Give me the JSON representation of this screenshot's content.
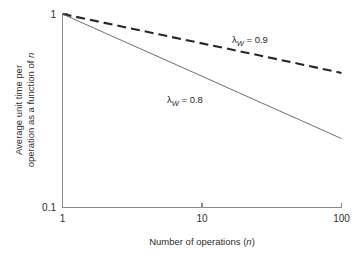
{
  "figure": {
    "background_color": "#ffffff",
    "axis_color": "#8a8a8a",
    "text_color": "#2e2e2e"
  },
  "axes": {
    "x_title_prefix": "Number of operations (",
    "x_title_italic": "n",
    "x_title_suffix": ")",
    "y_title_line1": "Average unit time per",
    "y_title_line2_prefix": "operation as a function of ",
    "y_title_line2_italic": "n",
    "x_ticklabels": [
      "1",
      "10",
      "100"
    ],
    "y_ticklabels": [
      "1",
      "0.1"
    ]
  },
  "annotations": {
    "curve_high": {
      "symbol": "λ",
      "subscript": "W",
      "equals": " = ",
      "value": "0.9"
    },
    "curve_low": {
      "symbol": "λ",
      "subscript": "W",
      "equals": " = ",
      "value": "0.8"
    }
  },
  "chart_data": {
    "type": "line",
    "title": "",
    "subtitle": "",
    "xlabel": "Number of operations (n)",
    "ylabel": "Average unit time per operation as a function of n",
    "xscale": "log",
    "yscale": "log",
    "xlim": [
      1,
      100
    ],
    "ylim": [
      0.1,
      1
    ],
    "x_ticks": [
      1,
      10,
      100
    ],
    "y_ticks": [
      1,
      0.1
    ],
    "grid": false,
    "legend": "inline-annotations",
    "x": [
      1,
      2,
      5,
      10,
      20,
      50,
      100
    ],
    "series": [
      {
        "name": "λW = 0.9",
        "style": "dashed",
        "color": "#262626",
        "annotation": "λW = 0.9",
        "values": [
          1.0,
          0.9,
          0.783,
          0.705,
          0.635,
          0.552,
          0.496
        ]
      },
      {
        "name": "λW = 0.8",
        "style": "solid",
        "color": "#6e6e6e",
        "annotation": "λW = 0.8",
        "values": [
          1.0,
          0.8,
          0.596,
          0.477,
          0.381,
          0.284,
          0.227
        ]
      }
    ]
  }
}
